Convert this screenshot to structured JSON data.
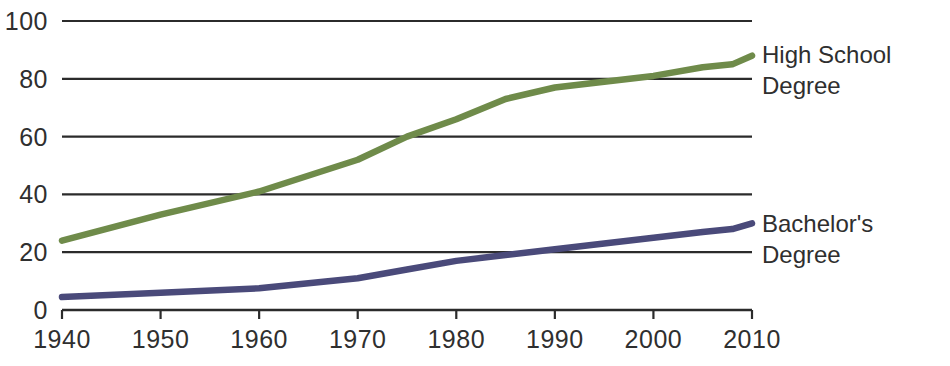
{
  "chart_data": {
    "type": "line",
    "title": "",
    "xlabel": "",
    "ylabel": "",
    "xlim": [
      1940,
      2010
    ],
    "ylim": [
      0,
      100
    ],
    "grid": true,
    "legend_position": "right-inline",
    "y_ticks": [
      "0",
      "20",
      "40",
      "60",
      "80",
      "100"
    ],
    "y_tick_values": [
      0,
      20,
      40,
      60,
      80,
      100
    ],
    "x_ticks": [
      "1940",
      "1950",
      "1960",
      "1970",
      "1980",
      "1990",
      "2000",
      "2010"
    ],
    "x_tick_values": [
      1940,
      1950,
      1960,
      1970,
      1980,
      1990,
      2000,
      2010
    ],
    "series": [
      {
        "name": "High School Degree",
        "label_lines": "High School\nDegree",
        "color": "#6f8b4a",
        "x": [
          1940,
          1950,
          1960,
          1970,
          1975,
          1980,
          1985,
          1990,
          1995,
          2000,
          2005,
          2008,
          2010
        ],
        "values": [
          24,
          33,
          41,
          52,
          60,
          66,
          73,
          77,
          79,
          81,
          84,
          85,
          88
        ]
      },
      {
        "name": "Bachelor's Degree",
        "label_lines": "Bachelor's Degree",
        "color": "#4a4a7a",
        "x": [
          1940,
          1950,
          1960,
          1970,
          1975,
          1980,
          1985,
          1990,
          1995,
          2000,
          2005,
          2008,
          2010
        ],
        "values": [
          4.5,
          6,
          7.5,
          11,
          14,
          17,
          19,
          21,
          23,
          25,
          27,
          28,
          30
        ]
      }
    ]
  },
  "colors": {
    "high_school": "#6f8b4a",
    "bachelors": "#4a4a7a",
    "axis": "#2b2b2b",
    "grid": "#2b2b2b",
    "background": "#ffffff"
  },
  "legend": {
    "high_school_label": "High School\nDegree",
    "bachelors_label": "Bachelor's Degree"
  }
}
